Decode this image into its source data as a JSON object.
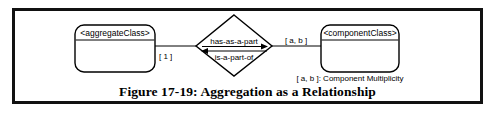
{
  "figure": {
    "caption": "Figure 17-19: Aggregation as a Relationship",
    "border_color": "#111111",
    "background_color": "#ffffff"
  },
  "diagram": {
    "aggregate_class": {
      "label": "<aggregateClass>",
      "multiplicity": "[ 1 ]"
    },
    "relationship_diamond": {
      "forward_label": "has-as-a-part",
      "reverse_label": "is-a-part-of",
      "forward_arrow": "arrow-right",
      "reverse_arrow": "arrow-left"
    },
    "component_class": {
      "label": "<componentClass>",
      "multiplicity": "[ a, b ]"
    },
    "legend": {
      "text": "[ a, b ]: Component Multiplicity"
    }
  }
}
